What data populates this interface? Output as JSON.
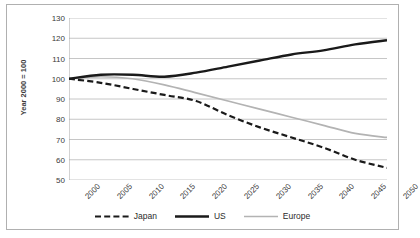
{
  "chart_data": {
    "type": "line",
    "title": "",
    "xlabel": "",
    "ylabel": "Year 2000 = 100",
    "x": [
      2000,
      2005,
      2010,
      2015,
      2020,
      2025,
      2030,
      2035,
      2040,
      2045,
      2050
    ],
    "xtick_labels": [
      "2000",
      "2005",
      "2010",
      "2015",
      "2020",
      "2025",
      "2030",
      "2035",
      "2040",
      "2045",
      "2050"
    ],
    "ytick_labels": [
      "130",
      "120",
      "110",
      "100",
      "90",
      "80",
      "70",
      "60",
      "50"
    ],
    "yticks": [
      130,
      120,
      110,
      100,
      90,
      80,
      70,
      60,
      50
    ],
    "ylim": [
      50,
      130
    ],
    "xlim": [
      2000,
      2050
    ],
    "grid": "horizontal",
    "legend_position": "bottom",
    "series": [
      {
        "name": "Japan",
        "style": "dashed",
        "color": "#1a1a1a",
        "values": [
          100,
          98,
          95,
          92,
          89,
          82,
          76,
          71,
          66,
          60,
          56
        ]
      },
      {
        "name": "US",
        "style": "solid-thick",
        "color": "#1a1a1a",
        "values": [
          100,
          102,
          102,
          101,
          103,
          106,
          109,
          112,
          114,
          117,
          119
        ]
      },
      {
        "name": "Europe",
        "style": "solid-thin",
        "color": "#b3b3b3",
        "values": [
          100,
          101,
          100,
          97,
          93,
          89,
          85,
          81,
          77,
          73,
          71
        ]
      }
    ]
  },
  "legend": {
    "items": [
      {
        "label": "Japan"
      },
      {
        "label": "US"
      },
      {
        "label": "Europe"
      }
    ]
  },
  "colors": {
    "japan": "#1a1a1a",
    "us": "#1a1a1a",
    "europe": "#b3b3b3",
    "grid": "#bfbfbf",
    "axis": "#a6a6a6",
    "border": "#b0b0b0",
    "text": "#3a3a3a"
  }
}
